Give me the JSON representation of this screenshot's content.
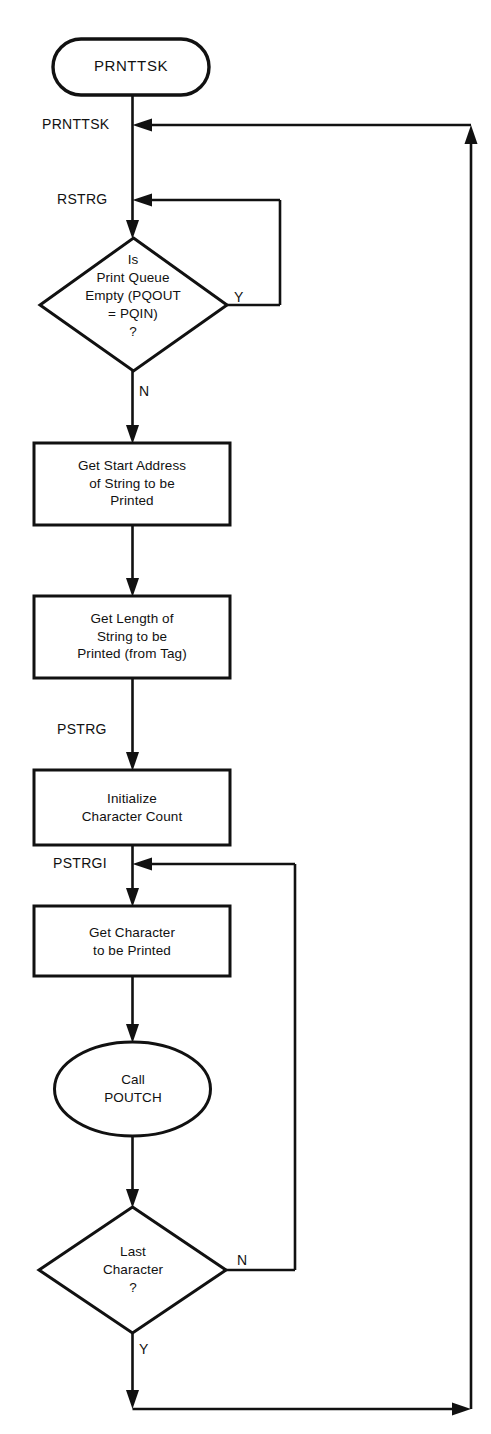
{
  "diagram": {
    "type": "flowchart",
    "background_color": "#ffffff",
    "line_color": "#111111",
    "nodes": {
      "start_terminator": {
        "shape": "terminator",
        "label": "PRNTTSK"
      },
      "decision_queue_empty": {
        "shape": "decision",
        "label": "Is\nPrint Queue\nEmpty (PQOUT\n= PQIN)\n?"
      },
      "process_get_start_address": {
        "shape": "process",
        "label": "Get Start Address\nof String to be\nPrinted"
      },
      "process_get_length": {
        "shape": "process",
        "label": "Get Length of\nString to be\nPrinted (from Tag)"
      },
      "process_init_count": {
        "shape": "process",
        "label": "Initialize\nCharacter Count"
      },
      "process_get_character": {
        "shape": "process",
        "label": "Get Character\nto be Printed"
      },
      "subroutine_call_poutch": {
        "shape": "ellipse",
        "label": "Call\nPOUTCH"
      },
      "decision_last_character": {
        "shape": "decision",
        "label": "Last\nCharacter\n?"
      }
    },
    "connector_labels": {
      "prnttsk_entry": "PRNTTSK",
      "rstrg_entry": "RSTRG",
      "pstrg_entry": "PSTRG",
      "pstrgi_entry": "PSTRGI"
    },
    "branch_labels": {
      "queue_empty_yes": "Y",
      "queue_empty_no": "N",
      "last_character_no": "N",
      "last_character_yes": "Y"
    }
  }
}
